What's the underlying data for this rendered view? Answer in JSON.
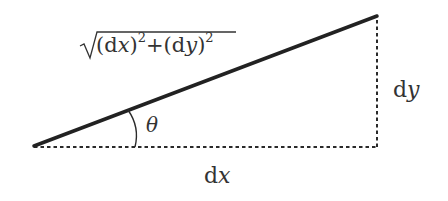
{
  "diagram": {
    "type": "right-triangle-arc-length",
    "colors": {
      "background": "#ffffff",
      "stroke": "#222222",
      "text": "#333333"
    },
    "vertices": {
      "left": [
        34,
        146
      ],
      "top_right": [
        377,
        16
      ],
      "bottom_right": [
        377,
        147
      ]
    },
    "hypotenuse": {
      "style": "solid",
      "width": 3.5,
      "label": {
        "radical": "√",
        "paren_open_1": "(",
        "d1": "d",
        "var1": "x",
        "paren_close_1": ")",
        "exp1": "2",
        "plus": "+",
        "paren_open_2": "(",
        "d2": "d",
        "var2": "y",
        "paren_close_2": ")",
        "exp2": "2",
        "full_text": "√((dx)²+(dy)²)"
      }
    },
    "base": {
      "style": "dashed",
      "label": {
        "d": "d",
        "var": "x",
        "full_text": "dx"
      }
    },
    "height": {
      "style": "dashed",
      "label": {
        "d": "d",
        "var": "y",
        "full_text": "dy"
      }
    },
    "angle": {
      "symbol": "θ",
      "at_vertex": "left"
    }
  }
}
